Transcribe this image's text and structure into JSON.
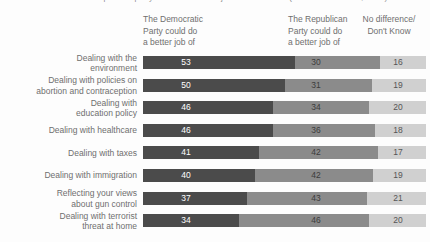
{
  "page": {
    "background": "#fdfdfd",
    "text_color": "#6f6f6f"
  },
  "clipped_caption": {
    "text": "Voters were asked which political party could do a better job on each issue (assessed Nov. 1-7, 2016)",
    "visibility": "clipped-at-top-edge-only-letter-bottoms-visible"
  },
  "headers": {
    "democratic": {
      "line1": "The Democratic",
      "line2": "Party could do",
      "line3": "a better job of"
    },
    "republican": {
      "line1": "The Republican",
      "line2": "Party could do",
      "line3": "a better job of"
    },
    "no_difference": {
      "line1": "No difference/",
      "line2": "Don't Know"
    }
  },
  "chart_data": {
    "type": "bar",
    "orientation": "horizontal",
    "stacked": true,
    "xlim": [
      0,
      100
    ],
    "grid": false,
    "legend_position": "column-headers-above-bars",
    "categories": [
      "Dealing with the environment",
      "Dealing with policies on abortion and contraception",
      "Dealing with education policy",
      "Dealing with healthcare",
      "Dealing with taxes",
      "Dealing with immigration",
      "Reflecting your views about gun control",
      "Dealing with terrorist threat at home"
    ],
    "category_lines": [
      [
        "Dealing with the",
        "environment"
      ],
      [
        "Dealing with policies on",
        "abortion and contraception"
      ],
      [
        "Dealing with",
        "education policy"
      ],
      [
        "Dealing with healthcare"
      ],
      [
        "Dealing with taxes"
      ],
      [
        "Dealing with immigration"
      ],
      [
        "Reflecting your views",
        "about gun control"
      ],
      [
        "Dealing with terrorist",
        "threat at home"
      ]
    ],
    "series": [
      {
        "key": "democratic",
        "name": "The Democratic Party could do a better job of",
        "color": "#4b4b4b",
        "value_color": "#ffffff",
        "values": [
          53,
          50,
          46,
          46,
          41,
          40,
          37,
          34
        ]
      },
      {
        "key": "republican",
        "name": "The Republican Party could do a better job of",
        "color": "#8b8b8b",
        "value_color": "#3c3c3c",
        "values": [
          30,
          31,
          34,
          36,
          42,
          42,
          43,
          46
        ]
      },
      {
        "key": "no-difference",
        "name": "No difference/Don't Know",
        "color": "#d0d0d0",
        "value_color": "#555555",
        "values": [
          16,
          19,
          20,
          18,
          17,
          19,
          21,
          20
        ]
      }
    ],
    "value_columns_x": [
      186,
      316,
      398
    ],
    "bar_area": {
      "left": 143,
      "width": 283,
      "bar_height": 13
    }
  }
}
